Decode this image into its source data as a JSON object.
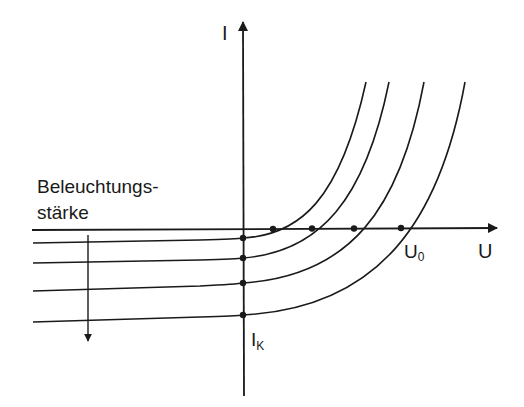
{
  "diagram": {
    "type": "solar-cell-iv-characteristics",
    "axes": {
      "y_label": "I",
      "x_label": "U",
      "x_intercept_label": "U",
      "x_intercept_sub": "0",
      "y_intercept_label": "I",
      "y_intercept_sub": "K"
    },
    "annotation": {
      "line1": "Beleuchtungs-",
      "line2": "stärke"
    },
    "curves": [
      {
        "name": "curve-1",
        "short_circuit_y": 238,
        "open_circuit_x": 273
      },
      {
        "name": "curve-2",
        "short_circuit_y": 258,
        "open_circuit_x": 312
      },
      {
        "name": "curve-3",
        "short_circuit_y": 283,
        "open_circuit_x": 354
      },
      {
        "name": "curve-4",
        "short_circuit_y": 315,
        "open_circuit_x": 401
      }
    ],
    "colors": {
      "line": "#1a1a1a",
      "background": "#ffffff"
    }
  }
}
